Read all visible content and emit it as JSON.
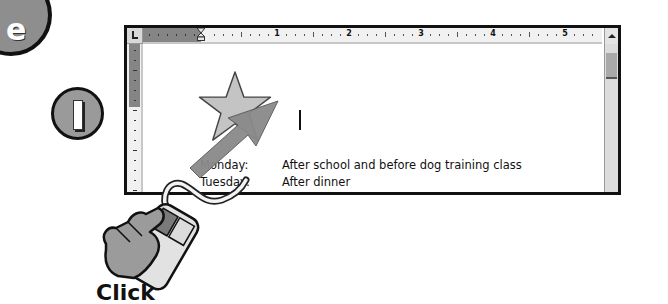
{
  "step_badges": {
    "section_letter": "e",
    "step_number": "1"
  },
  "window": {
    "ruler": {
      "tab_selector_icon": "left-tab-icon",
      "numbers": [
        "1",
        "2",
        "3",
        "4",
        "5"
      ]
    },
    "scrollbar": {
      "up_arrow_icon": "scroll-up-arrow-icon"
    },
    "document": {
      "shape": "star",
      "lines": [
        {
          "day": "Monday:",
          "text": "After school and before dog training class"
        },
        {
          "day": "Tuesday:",
          "text": "After dinner"
        }
      ]
    }
  },
  "annotations": {
    "pointer_arrow_icon": "arrow-pointer-icon",
    "mouse_icon": "mouse-click-hand-icon",
    "caption": "Click"
  },
  "colors": {
    "ruler_margin": "#858585",
    "ruler_bg": "#f1f1f1",
    "star_fill": "#c4c4c4",
    "arrow_fill": "#8a8a8a",
    "border": "#111111"
  }
}
